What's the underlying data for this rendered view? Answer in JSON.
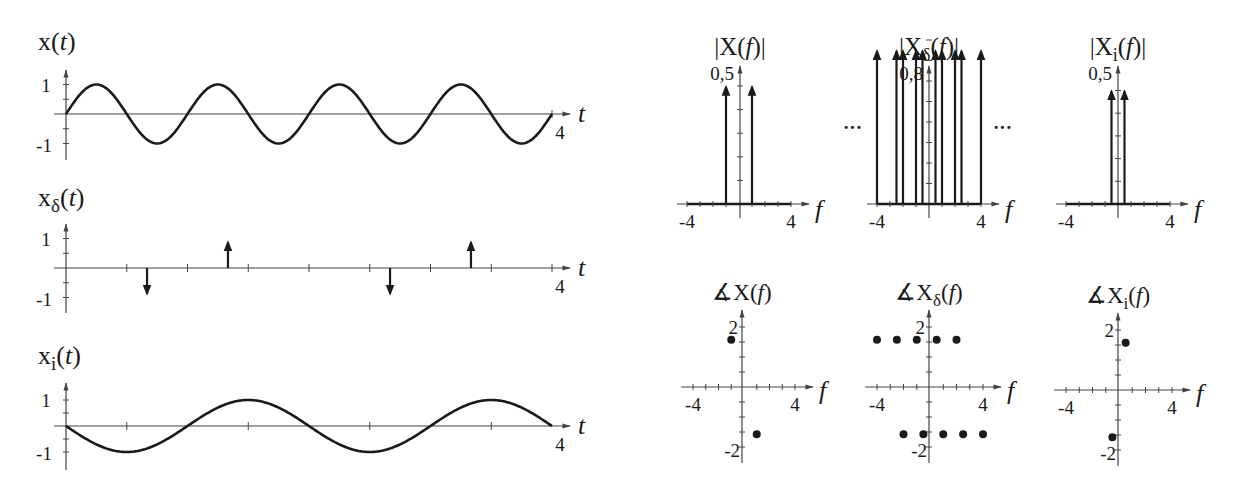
{
  "chart_data": [
    {
      "id": "x_t",
      "type": "line",
      "title": "x(t)",
      "title_parts": {
        "main": "x(",
        "sub": "",
        "var": "t",
        "close": ")"
      },
      "xlabel": "t",
      "xlim": [
        0,
        4
      ],
      "ylim": [
        -1,
        1
      ],
      "x_tick_labels": [
        "4"
      ],
      "y_tick_labels": [
        "1",
        "-1"
      ],
      "x_minor_step": 0.5,
      "y_minor_step": 0.5,
      "function": "sin(2*pi*1*t)",
      "frequency_hz": 1,
      "amplitude": 1,
      "phase_sign": 1
    },
    {
      "id": "x_delta_t",
      "type": "stem",
      "title": "xδ(t)",
      "title_parts": {
        "main": "x",
        "sub": "δ",
        "var": "t",
        "close": ")"
      },
      "xlabel": "t",
      "xlim": [
        0,
        4
      ],
      "ylim": [
        -1,
        1
      ],
      "x_tick_labels": [
        "4"
      ],
      "y_tick_labels": [
        "1",
        "-1"
      ],
      "x_minor_step": 0.5,
      "y_minor_step": 0.5,
      "impulses": [
        {
          "t": 0.0,
          "value": 0.0
        },
        {
          "t": 0.667,
          "value": -0.866
        },
        {
          "t": 1.333,
          "value": 0.866
        },
        {
          "t": 2.0,
          "value": 0.0
        },
        {
          "t": 2.667,
          "value": -0.866
        },
        {
          "t": 3.333,
          "value": 0.866
        },
        {
          "t": 4.0,
          "value": 0.0
        }
      ]
    },
    {
      "id": "x_i_t",
      "type": "line",
      "title": "xi(t)",
      "title_parts": {
        "main": "x",
        "sub": "i",
        "var": "t",
        "close": ")"
      },
      "xlabel": "t",
      "xlim": [
        0,
        4
      ],
      "ylim": [
        -1,
        1
      ],
      "x_tick_labels": [
        "4"
      ],
      "y_tick_labels": [
        "1",
        "-1"
      ],
      "x_minor_ticks": [
        0.5,
        1.5,
        2.5,
        3.5
      ],
      "y_minor_step": 0.5,
      "function": "-sin(2*pi*0.5*t)",
      "frequency_hz": 0.5,
      "amplitude": 1,
      "phase_sign": -1
    },
    {
      "id": "mag_X",
      "type": "stem",
      "title": "|X(f)|",
      "title_parts": {
        "pre": "|X",
        "sub": "",
        "var": "f",
        "close": ")|"
      },
      "xlabel": "f",
      "xlim": [
        -4,
        4
      ],
      "ylim": [
        0,
        0.5
      ],
      "x_tick_labels": [
        "-4",
        "4"
      ],
      "y_tick_label": "0,5",
      "y_tick_step": 0.1,
      "impulses": [
        {
          "f": -1,
          "value": 0.5
        },
        {
          "f": 1,
          "value": 0.5
        }
      ]
    },
    {
      "id": "mag_X_delta",
      "type": "stem",
      "title": "|Xδ(f)|",
      "title_parts": {
        "pre": "|X",
        "sub": "δ",
        "var": "f",
        "close": ")|"
      },
      "xlabel": "f",
      "xlim": [
        -4,
        4
      ],
      "ylim": [
        0,
        0.8
      ],
      "x_tick_labels": [
        "-4",
        "4"
      ],
      "y_tick_label": "0,8",
      "y_tick_step": 0.1,
      "continuation": "···",
      "impulses": [
        {
          "f": -4,
          "value": 0.75
        },
        {
          "f": -2.5,
          "value": 0.75
        },
        {
          "f": -2,
          "value": 0.75
        },
        {
          "f": -1,
          "value": 0.75
        },
        {
          "f": -0.5,
          "value": 0.75
        },
        {
          "f": 0.5,
          "value": 0.75
        },
        {
          "f": 1,
          "value": 0.75
        },
        {
          "f": 2,
          "value": 0.75
        },
        {
          "f": 2.5,
          "value": 0.75
        },
        {
          "f": 4,
          "value": 0.75
        }
      ]
    },
    {
      "id": "mag_X_i",
      "type": "stem",
      "title": "|Xi(f)|",
      "title_parts": {
        "pre": "|X",
        "sub": "i",
        "var": "f",
        "close": ")|"
      },
      "xlabel": "f",
      "xlim": [
        -4,
        4
      ],
      "ylim": [
        0,
        0.5
      ],
      "x_tick_labels": [
        "-4",
        "4"
      ],
      "y_tick_label": "0,5",
      "y_tick_step": 0.1,
      "impulses": [
        {
          "f": -0.5,
          "value": 0.5
        },
        {
          "f": 0.5,
          "value": 0.5
        }
      ]
    },
    {
      "id": "phase_X",
      "type": "scatter",
      "title": "∡X(f)",
      "title_parts": {
        "pre": "∡X",
        "sub": "",
        "var": "f",
        "close": ")"
      },
      "xlabel": "f",
      "xlim": [
        -4,
        4
      ],
      "ylim": [
        -2,
        2
      ],
      "x_tick_labels": [
        "-4",
        "4"
      ],
      "y_tick_labels": [
        "2",
        "-2"
      ],
      "y_minor_step": 0.5,
      "points": [
        {
          "f": -1,
          "phase": 1.571
        },
        {
          "f": 1,
          "phase": -1.571
        }
      ]
    },
    {
      "id": "phase_X_delta",
      "type": "scatter",
      "title": "∡Xδ(f)",
      "title_parts": {
        "pre": "∡X",
        "sub": "δ",
        "var": "f",
        "close": ")"
      },
      "xlabel": "f",
      "xlim": [
        -4,
        4
      ],
      "ylim": [
        -2,
        2
      ],
      "x_tick_labels": [
        "-4",
        "4"
      ],
      "y_tick_labels": [
        "2",
        "-2"
      ],
      "y_minor_step": 0.5,
      "points": [
        {
          "f": -4,
          "phase": 1.571
        },
        {
          "f": -2.5,
          "phase": 1.571
        },
        {
          "f": -1,
          "phase": 1.571
        },
        {
          "f": 0.5,
          "phase": 1.571
        },
        {
          "f": 2,
          "phase": 1.571
        },
        {
          "f": -2,
          "phase": -1.571
        },
        {
          "f": -0.5,
          "phase": -1.571
        },
        {
          "f": 1,
          "phase": -1.571
        },
        {
          "f": 2.5,
          "phase": -1.571
        },
        {
          "f": 4,
          "phase": -1.571
        }
      ]
    },
    {
      "id": "phase_X_i",
      "type": "scatter",
      "title": "∡Xi(f)",
      "title_parts": {
        "pre": "∡X",
        "sub": "i",
        "var": "f",
        "close": ")"
      },
      "xlabel": "f",
      "xlim": [
        -4,
        4
      ],
      "ylim": [
        -2,
        2
      ],
      "x_tick_labels": [
        "-4",
        "4"
      ],
      "y_tick_labels": [
        "2",
        "-2"
      ],
      "y_minor_step": 0.5,
      "points": [
        {
          "f": 0.5,
          "phase": 1.571
        },
        {
          "f": -0.5,
          "phase": -1.571
        }
      ]
    }
  ],
  "style": {
    "ink": "#1a1a1a",
    "axis": "#444444",
    "background": "#ffffff"
  }
}
